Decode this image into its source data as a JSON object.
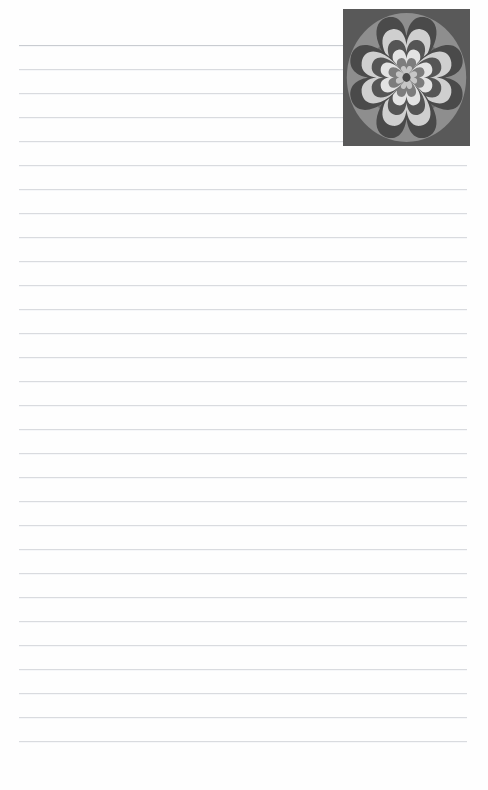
{
  "page": {
    "title": "Lined Note Page",
    "width": 488,
    "height": 790,
    "background_color": "#fefefe"
  },
  "ruled_lines": {
    "name": "ruled-writing-lines",
    "count": 30,
    "first_line_y": 45,
    "spacing": 24,
    "left_x": 19,
    "right_x": 467,
    "thickness": 1,
    "color": "#d9dbdf",
    "first_line_color": "#c9ccd1",
    "label": "Ruled writing lines"
  },
  "decorative_tile": {
    "name": "decorative-heart-mandala-tile",
    "label": "Four-heart radial mandala",
    "x": 343,
    "y": 9,
    "width": 127,
    "height": 137,
    "background_color": "#595959",
    "circle_color": "#8e8e8e",
    "inner_circle_color": "#6e6e6e",
    "petal_count": 4,
    "petal_angles": [
      0,
      90,
      180,
      270
    ],
    "heart_rings": [
      {
        "name": "ring-outer-dark",
        "color": "#4a4a4a",
        "scale": 1.0
      },
      {
        "name": "ring-light",
        "color": "#cfcfcf",
        "scale": 0.8
      },
      {
        "name": "ring-mid-dark",
        "color": "#555555",
        "scale": 0.62
      },
      {
        "name": "ring-pale",
        "color": "#e3e3e3",
        "scale": 0.46
      },
      {
        "name": "ring-gray",
        "color": "#7d7d7d",
        "scale": 0.32
      },
      {
        "name": "ring-core-light",
        "color": "#c6c6c6",
        "scale": 0.19
      }
    ],
    "center_color": "#4a4a4a"
  }
}
